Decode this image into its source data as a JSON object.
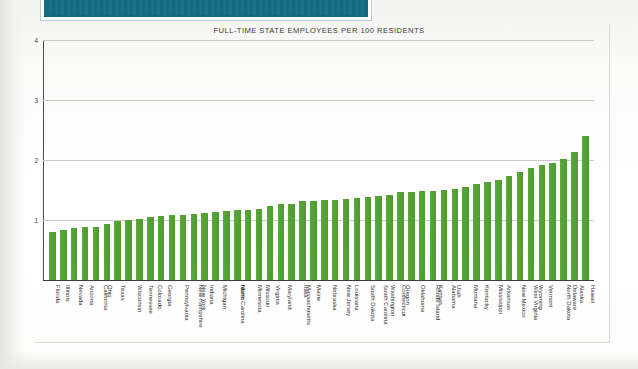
{
  "banner": {
    "name": "teal-masthead-band",
    "color": "#15697c"
  },
  "chart_data": {
    "type": "bar",
    "title": "FULL-TIME STATE EMPLOYEES PER 100 RESIDENTS",
    "xlabel": "",
    "ylabel": "",
    "ylim": [
      0,
      4
    ],
    "yticks": [
      "1",
      "2",
      "3",
      "4"
    ],
    "ytick_values": [
      1,
      2,
      3,
      4
    ],
    "grid": true,
    "legend": "none",
    "bar_color": "#55a336",
    "categories": [
      "Florida",
      "Illinois",
      "Nevada",
      "Arizona",
      "California",
      "Ohio",
      "Texas",
      "Wisconsin",
      "Tennessee",
      "Colorado",
      "Georgia",
      "Pennsylvania",
      "New Hampshire",
      "New York",
      "Indiana",
      "Michigan",
      "North Carolina",
      "Idaho",
      "Minnesota",
      "Missouri",
      "Virginia",
      "Maryland",
      "Massachusetts",
      "Iowa",
      "Maine",
      "Nebraska",
      "New Jersey",
      "Louisiana",
      "South Dakota",
      "South Carolina",
      "Washington",
      "Connecticut",
      "Oregon",
      "Oklahoma",
      "Rhode Island",
      "Kansas",
      "Alabama",
      "Utah",
      "Montana",
      "Kentucky",
      "Mississippi",
      "Arkansas",
      "New Mexico",
      "West Virginia",
      "Wyoming",
      "Vermont",
      "North Dakota",
      "Delaware",
      "Alaska",
      "Hawaii"
    ],
    "values": [
      0.8,
      0.83,
      0.87,
      0.88,
      0.89,
      0.93,
      0.99,
      1.0,
      1.01,
      1.05,
      1.07,
      1.08,
      1.09,
      1.1,
      1.12,
      1.13,
      1.15,
      1.16,
      1.17,
      1.19,
      1.23,
      1.26,
      1.27,
      1.31,
      1.32,
      1.33,
      1.34,
      1.35,
      1.37,
      1.38,
      1.4,
      1.42,
      1.46,
      1.47,
      1.48,
      1.49,
      1.5,
      1.51,
      1.55,
      1.6,
      1.63,
      1.67,
      1.74,
      1.8,
      1.86,
      1.92,
      1.95,
      2.02,
      2.14,
      2.4
    ]
  }
}
